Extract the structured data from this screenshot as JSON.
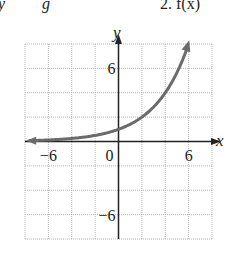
{
  "header_fragment": {
    "left": "y",
    "mid": "g",
    "right": "2. f(x)"
  },
  "chart_data": {
    "type": "line",
    "title": "",
    "xlabel": "x",
    "ylabel": "y",
    "xlim": [
      -8,
      8
    ],
    "ylim": [
      -8,
      8
    ],
    "grid": true,
    "grid_step": 2,
    "x_ticks_labeled": [
      {
        "value": -6,
        "label": "−6"
      },
      {
        "value": 0,
        "label": "0"
      },
      {
        "value": 6,
        "label": "6"
      }
    ],
    "y_ticks_labeled": [
      {
        "value": 6,
        "label": "6"
      },
      {
        "value": -6,
        "label": "−6"
      }
    ],
    "series": [
      {
        "name": "f(x)",
        "description": "exponential growth curve, approx y = 2^(x/2), arrows at both ends",
        "x": [
          -8,
          -6,
          -4,
          -2,
          0,
          1,
          2,
          3,
          4,
          5,
          6
        ],
        "y": [
          0.06,
          0.13,
          0.25,
          0.5,
          1,
          1.41,
          2,
          2.83,
          4,
          5.66,
          8
        ],
        "color": "#6b6b6b"
      }
    ]
  },
  "colors": {
    "grid": "#b5b5b5",
    "axis": "#222222",
    "curve": "#6b6b6b"
  }
}
